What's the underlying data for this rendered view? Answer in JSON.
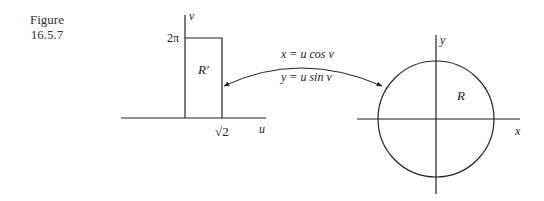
{
  "figure": {
    "caption_line1": "Figure",
    "caption_line2": "16.5.7"
  },
  "left_plot": {
    "vertical_axis_label": "v",
    "horizontal_axis_label": "u",
    "top_tick_label": "2π",
    "right_tick_label": "√2",
    "region_label": "R′"
  },
  "transform": {
    "equation_x": "x = u cos v",
    "equation_y": "y = u sin v"
  },
  "right_plot": {
    "vertical_axis_label": "y",
    "horizontal_axis_label": "x",
    "region_label": "R"
  },
  "colors": {
    "stroke": "#222222",
    "background": "#ffffff"
  }
}
